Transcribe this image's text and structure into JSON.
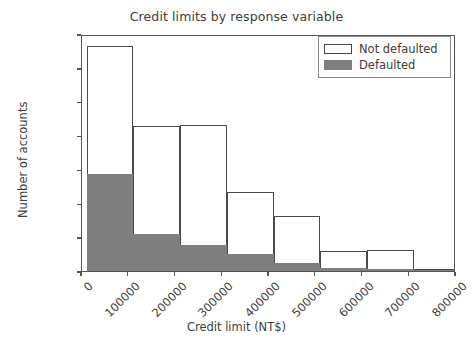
{
  "chart_data": {
    "type": "bar",
    "subtype": "overlaid-histogram",
    "title": "Credit limits by response variable",
    "xlabel": "Credit limit (NT$)",
    "ylabel": "Number of accounts",
    "xlim": [
      0,
      800000
    ],
    "ylim": [
      0,
      7000
    ],
    "grid": false,
    "legend_position": "upper right",
    "xticks": [
      0,
      100000,
      200000,
      300000,
      400000,
      500000,
      600000,
      700000,
      800000
    ],
    "xtick_labels": [
      "0",
      "100000",
      "200000",
      "300000",
      "400000",
      "500000",
      "600000",
      "700000",
      "800000"
    ],
    "xtick_rotation": -45,
    "yticks": [
      0,
      1000,
      2000,
      3000,
      4000,
      5000,
      6000,
      7000
    ],
    "ytick_labels": [
      "0",
      "1000",
      "2000",
      "3000",
      "4000",
      "5000",
      "6000",
      "7000"
    ],
    "bin_edges": [
      10000,
      110000,
      210000,
      310000,
      410000,
      510000,
      610000,
      710000,
      800000
    ],
    "categories": [
      "10000-110000",
      "110000-210000",
      "210000-310000",
      "310000-410000",
      "410000-510000",
      "510000-610000",
      "610000-710000",
      "710000-800000"
    ],
    "series": [
      {
        "name": "Not defaulted",
        "color": "#ffffff",
        "edge_color": "#4a4a4a",
        "values": [
          6650,
          4280,
          4310,
          2320,
          1620,
          590,
          630,
          40
        ]
      },
      {
        "name": "Defaulted",
        "color": "#7f7f7f",
        "edge_color": "#7f7f7f",
        "values": [
          2870,
          1100,
          760,
          490,
          250,
          90,
          70,
          10
        ]
      }
    ]
  },
  "legend": {
    "entries": [
      {
        "label": "Not defaulted",
        "swatch": "outline-rect-icon"
      },
      {
        "label": "Defaulted",
        "swatch": "filled-rect-icon"
      }
    ]
  },
  "colors": {
    "defaulted_fill": "#7f7f7f",
    "not_defaulted_fill": "#ffffff",
    "axis": "#555555",
    "text": "#3d3d3d"
  }
}
